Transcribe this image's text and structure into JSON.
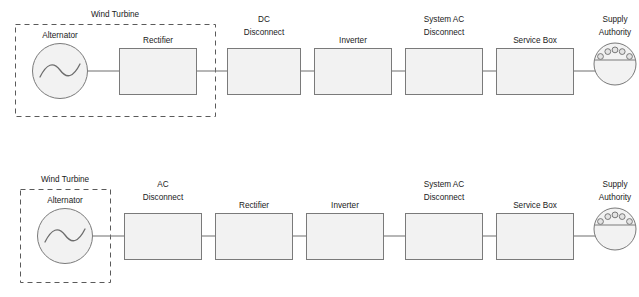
{
  "diagram": {
    "background_color": "#ffffff",
    "box_fill_color": "#f2f2f2",
    "box_stroke_color": "#7a7a7a",
    "dashed_stroke_color": "#5a5a5a",
    "line_color": "#7a7a7a",
    "text_color": "#1a1a1a"
  },
  "rows": [
    {
      "id": "row-1",
      "group_label": "Wind Turbine",
      "nodes": [
        {
          "id": "alternator-1",
          "label": "Alternator",
          "shape": "circle-sine",
          "in_group": true
        },
        {
          "id": "rectifier-1",
          "label": "Rectifier",
          "shape": "rect",
          "in_group": true
        },
        {
          "id": "dc-disconnect-1",
          "label_line1": "DC",
          "label_line2": "Disconnect",
          "shape": "rect",
          "in_group": false
        },
        {
          "id": "inverter-1",
          "label": "Inverter",
          "shape": "rect",
          "in_group": false
        },
        {
          "id": "system-ac-disconnect-1",
          "label_line1": "System AC",
          "label_line2": "Disconnect",
          "shape": "rect",
          "in_group": false
        },
        {
          "id": "service-box-1",
          "label": "Service Box",
          "shape": "rect",
          "in_group": false
        },
        {
          "id": "supply-authority-1",
          "label_line1": "Supply",
          "label_line2": "Authority",
          "shape": "circle-meter",
          "in_group": false
        }
      ]
    },
    {
      "id": "row-2",
      "group_label": "Wind Turbine",
      "nodes": [
        {
          "id": "alternator-2",
          "label": "Alternator",
          "shape": "circle-sine",
          "in_group": true
        },
        {
          "id": "ac-disconnect-2",
          "label_line1": "AC",
          "label_line2": "Disconnect",
          "shape": "rect",
          "in_group": false
        },
        {
          "id": "rectifier-2",
          "label": "Rectifier",
          "shape": "rect",
          "in_group": false
        },
        {
          "id": "inverter-2",
          "label": "Inverter",
          "shape": "rect",
          "in_group": false
        },
        {
          "id": "system-ac-disconnect-2",
          "label_line1": "System AC",
          "label_line2": "Disconnect",
          "shape": "rect",
          "in_group": false
        },
        {
          "id": "service-box-2",
          "label": "Service Box",
          "shape": "rect",
          "in_group": false
        },
        {
          "id": "supply-authority-2",
          "label_line1": "Supply",
          "label_line2": "Authority",
          "shape": "circle-meter",
          "in_group": false
        }
      ]
    }
  ]
}
